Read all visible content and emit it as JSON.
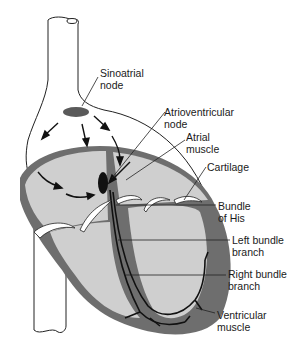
{
  "diagram": {
    "labels": {
      "sinoatrial_node": [
        "Sinoatrial",
        "node"
      ],
      "atrioventricular_node": [
        "Atrioventricular",
        "node"
      ],
      "atrial_muscle": [
        "Atrial",
        "muscle"
      ],
      "cartilage": [
        "Cartilage"
      ],
      "bundle_of_his": [
        "Bundle",
        "of His"
      ],
      "left_bundle_branch": [
        "Left bundle",
        "branch"
      ],
      "right_bundle_branch": [
        "Right bundle",
        "branch"
      ],
      "ventricular_muscle": [
        "Ventricular",
        "muscle"
      ]
    },
    "colors": {
      "muscle": "#6e6e6e",
      "chamber": "#cfcfcf",
      "node": "#5a5a5a",
      "av_node": "#111111",
      "vessel": "#ffffff",
      "outline": "#222222",
      "cartilage": "#ffffff"
    }
  }
}
